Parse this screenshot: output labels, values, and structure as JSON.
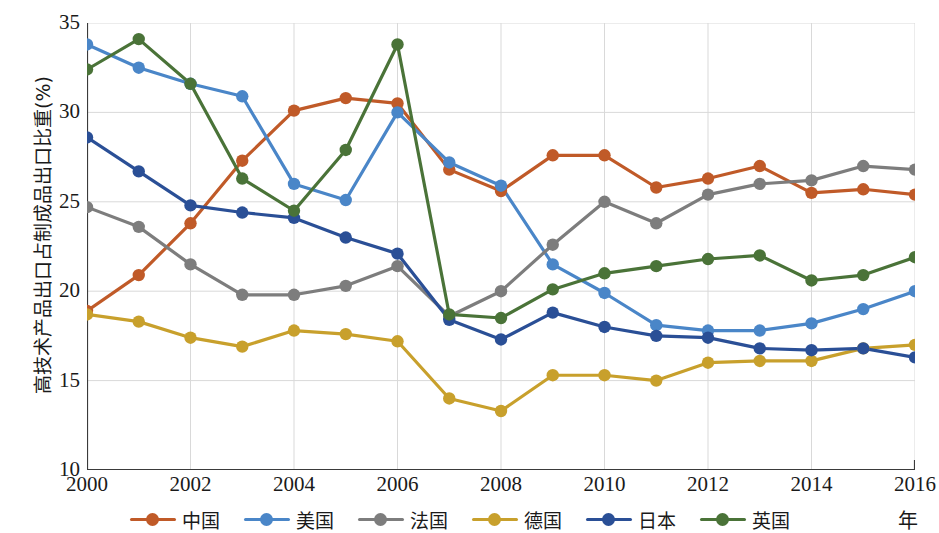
{
  "chart_data": {
    "type": "line",
    "title": "",
    "xlabel": "年",
    "ylabel": "高技术产品出口占制成品出口比重(%)",
    "x": [
      2000,
      2001,
      2002,
      2003,
      2004,
      2005,
      2006,
      2007,
      2008,
      2009,
      2010,
      2011,
      2012,
      2013,
      2014,
      2015,
      2016
    ],
    "xlim": [
      2000,
      2016
    ],
    "ylim": [
      10,
      35
    ],
    "xticks": [
      2000,
      2002,
      2004,
      2006,
      2008,
      2010,
      2012,
      2014,
      2016
    ],
    "yticks": [
      10,
      15,
      20,
      25,
      30,
      35
    ],
    "grid": true,
    "legend_position": "bottom",
    "series": [
      {
        "name": "中国",
        "color": "#c05a28",
        "values": [
          18.9,
          20.9,
          23.8,
          27.3,
          30.1,
          30.8,
          30.5,
          26.8,
          25.6,
          27.6,
          27.6,
          25.8,
          26.3,
          27.0,
          25.5,
          25.7,
          25.4
        ]
      },
      {
        "name": "美国",
        "color": "#4a86c8",
        "values": [
          33.8,
          32.5,
          31.6,
          30.9,
          26.0,
          25.1,
          30.0,
          27.2,
          25.9,
          21.5,
          19.9,
          18.1,
          17.8,
          17.8,
          18.2,
          19.0,
          20.0
        ]
      },
      {
        "name": "法国",
        "color": "#7d7d7d",
        "values": [
          24.7,
          23.6,
          21.5,
          19.8,
          19.8,
          20.3,
          21.4,
          18.6,
          20.0,
          22.6,
          25.0,
          23.8,
          25.4,
          26.0,
          26.2,
          27.0,
          26.8
        ]
      },
      {
        "name": "德国",
        "color": "#c8a02c",
        "values": [
          18.7,
          18.3,
          17.4,
          16.9,
          17.8,
          17.6,
          17.2,
          14.0,
          13.3,
          15.3,
          15.3,
          15.0,
          16.0,
          16.1,
          16.1,
          16.8,
          17.0
        ]
      },
      {
        "name": "日本",
        "color": "#2a4f96",
        "values": [
          28.6,
          26.7,
          24.8,
          24.4,
          24.1,
          23.0,
          22.1,
          18.4,
          17.3,
          18.8,
          18.0,
          17.5,
          17.4,
          16.8,
          16.7,
          16.8,
          16.3
        ]
      },
      {
        "name": "英国",
        "color": "#4a7338",
        "values": [
          32.4,
          34.1,
          31.6,
          26.3,
          24.5,
          27.9,
          33.8,
          18.7,
          18.5,
          20.1,
          21.0,
          21.4,
          21.8,
          22.0,
          20.6,
          20.9,
          21.9
        ]
      }
    ]
  },
  "axis": {
    "y_title": "高技术产品出口占制成品出口比重(%)",
    "x_unit": "年",
    "y_tick_labels": [
      "35",
      "30",
      "25",
      "20",
      "15",
      "10"
    ],
    "x_tick_labels": [
      "2000",
      "2002",
      "2004",
      "2006",
      "2008",
      "2010",
      "2012",
      "2014",
      "2016"
    ]
  }
}
